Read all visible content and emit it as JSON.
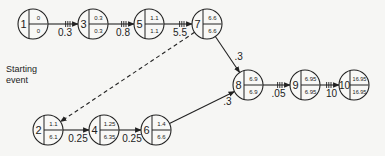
{
  "diagram": {
    "type": "pert-network",
    "labels": {
      "start": "Starting event",
      "start_line1": "Starting",
      "start_line2": "event",
      "final_line1": "Final",
      "final_line2": "event"
    },
    "nodes": [
      {
        "id": "1",
        "top": "0",
        "bottom": "0",
        "cx": 33,
        "cy": 24
      },
      {
        "id": "3",
        "top": "0.3",
        "bottom": "0.3",
        "cx": 93,
        "cy": 24
      },
      {
        "id": "5",
        "top": "1.1",
        "bottom": "1.1",
        "cx": 149,
        "cy": 24
      },
      {
        "id": "7",
        "top": "6.6",
        "bottom": "6.6",
        "cx": 207,
        "cy": 24
      },
      {
        "id": "8",
        "top": "6.9",
        "bottom": "6.9",
        "cx": 248,
        "cy": 85
      },
      {
        "id": "9",
        "top": "6.95",
        "bottom": "6.95",
        "cx": 305,
        "cy": 85
      },
      {
        "id": "10",
        "top": "16.95",
        "bottom": "16.95",
        "cx": 354,
        "cy": 85
      },
      {
        "id": "2",
        "top": "1.1",
        "bottom": "6.1",
        "cx": 48,
        "cy": 130
      },
      {
        "id": "4",
        "top": "1.25",
        "bottom": "6.35",
        "cx": 104,
        "cy": 130
      },
      {
        "id": "6",
        "top": "1.4",
        "bottom": "6.6",
        "cx": 156,
        "cy": 130
      }
    ],
    "edges": [
      {
        "from": "1",
        "to": "3",
        "label": "0.3",
        "critical": true
      },
      {
        "from": "3",
        "to": "5",
        "label": "0.8",
        "critical": true
      },
      {
        "from": "5",
        "to": "7",
        "label": "5.5",
        "critical": true
      },
      {
        "from": "7",
        "to": "8",
        "label": ".3",
        "critical": false
      },
      {
        "from": "8",
        "to": "9",
        "label": ".05",
        "critical": true
      },
      {
        "from": "9",
        "to": "10",
        "label": "10",
        "critical": true
      },
      {
        "from": "2",
        "to": "4",
        "label": "0.25",
        "critical": false
      },
      {
        "from": "4",
        "to": "6",
        "label": "0.25",
        "critical": false
      },
      {
        "from": "6",
        "to": "8",
        "label": ".3",
        "critical": false
      },
      {
        "from": "7",
        "to": "2",
        "label": "",
        "dashed": true
      }
    ]
  }
}
